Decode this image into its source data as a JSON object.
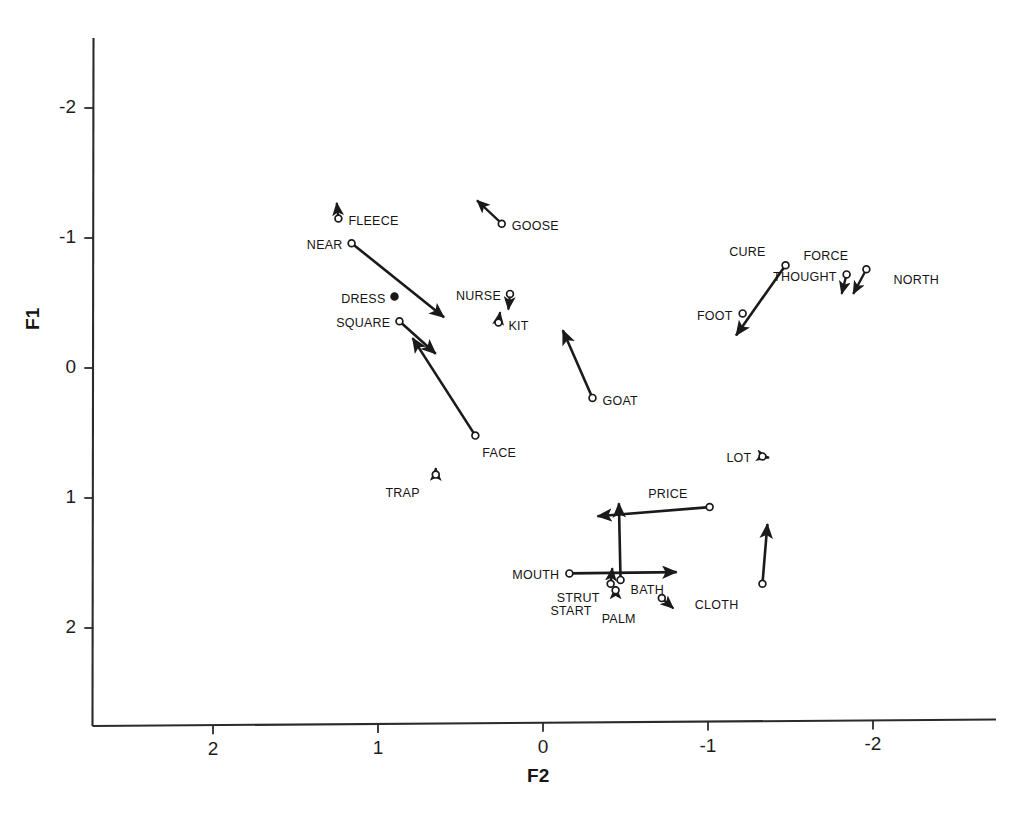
{
  "chart_data": {
    "type": "scatter",
    "title": "",
    "xlabel": "F2",
    "ylabel": "F1",
    "xlim": [
      2.75,
      -2.75
    ],
    "ylim": [
      2.75,
      -2.4
    ],
    "x_ticks": [
      2,
      1,
      0,
      -1,
      -2
    ],
    "x_tick_labels": [
      "2",
      "1",
      "0",
      "-1",
      "-2"
    ],
    "y_ticks": [
      -2,
      -1,
      0,
      1,
      2
    ],
    "y_tick_labels": [
      "-2",
      "-1",
      "0",
      "1",
      "2"
    ],
    "grid": false,
    "legend": false,
    "axes_style": "open-corner-scanned",
    "marker": "open-circle",
    "vector_style": "arrow",
    "points": [
      {
        "label": "FLEECE",
        "x": 1.24,
        "y": -1.15,
        "dx": 0.01,
        "dy": -0.12,
        "label_side": "right",
        "marker": "open",
        "label_dx": 10,
        "label_dy": -5
      },
      {
        "label": "GOOSE",
        "x": 0.25,
        "y": -1.11,
        "dx": 0.15,
        "dy": -0.18,
        "label_side": "right",
        "marker": "open",
        "label_dx": 10,
        "label_dy": -5
      },
      {
        "label": "NEAR",
        "x": 1.16,
        "y": -0.96,
        "dx": -0.56,
        "dy": 0.57,
        "label_side": "left",
        "marker": "open",
        "label_dx": -9,
        "label_dy": -5
      },
      {
        "label": "DRESS",
        "x": 0.9,
        "y": -0.55,
        "dx": 0.0,
        "dy": 0.0,
        "label_side": "left",
        "marker": "filled",
        "label_dx": -9,
        "label_dy": -5
      },
      {
        "label": "NURSE",
        "x": 0.2,
        "y": -0.57,
        "dx": 0.01,
        "dy": 0.12,
        "label_side": "left",
        "marker": "open",
        "label_dx": -9,
        "label_dy": -5
      },
      {
        "label": "KIT",
        "x": 0.27,
        "y": -0.35,
        "dx": -0.01,
        "dy": -0.08,
        "label_side": "right",
        "marker": "open",
        "label_dx": 10,
        "label_dy": -4
      },
      {
        "label": "SQUARE",
        "x": 0.87,
        "y": -0.36,
        "dx": -0.22,
        "dy": 0.25,
        "label_side": "left",
        "marker": "open",
        "label_dx": -9,
        "label_dy": -5
      },
      {
        "label": "FACE",
        "x": 0.41,
        "y": 0.52,
        "dx": 0.38,
        "dy": -0.75,
        "label_side": "right",
        "marker": "open",
        "label_dx": 7,
        "label_dy": 10
      },
      {
        "label": "TRAP",
        "x": 0.65,
        "y": 0.82,
        "dx": 0.0,
        "dy": -0.05,
        "label_side": "below",
        "marker": "open",
        "label_dx": -16,
        "label_dy": 11
      },
      {
        "label": "GOAT",
        "x": -0.3,
        "y": 0.23,
        "dx": 0.18,
        "dy": -0.52,
        "label_side": "right",
        "marker": "open",
        "label_dx": 10,
        "label_dy": -4
      },
      {
        "label": "CURE",
        "x": -1.47,
        "y": -0.79,
        "dx": 0.3,
        "dy": 0.54,
        "label_side": "above",
        "marker": "open",
        "label_dx": -20,
        "label_dy": -20
      },
      {
        "label": "THOUGHT",
        "x": -1.84,
        "y": -0.72,
        "dx": 0.03,
        "dy": 0.15,
        "label_side": "left",
        "marker": "open",
        "label_dx": -10,
        "label_dy": -4
      },
      {
        "label": "FORCE",
        "x": -1.96,
        "y": -0.76,
        "dx": 0.08,
        "dy": 0.19,
        "label_side": "above",
        "marker": "open",
        "label_dx": -18,
        "label_dy": -20
      },
      {
        "label": "NORTH",
        "x": -2.04,
        "y": -0.7,
        "dx": 0.0,
        "dy": 0.0,
        "label_side": "right",
        "marker": "none",
        "label_dx": 14,
        "label_dy": -4
      },
      {
        "label": "FOOT",
        "x": -1.21,
        "y": -0.42,
        "dx": 0.0,
        "dy": 0.0,
        "label_side": "left",
        "marker": "open",
        "label_dx": -10,
        "label_dy": -4
      },
      {
        "label": "LOT",
        "x": -1.33,
        "y": 0.68,
        "dx": -0.04,
        "dy": 0.01,
        "label_side": "left",
        "marker": "open",
        "label_dx": -11,
        "label_dy": -5
      },
      {
        "label": "PRICE",
        "x": -1.01,
        "y": 1.07,
        "dx": 0.68,
        "dy": 0.07,
        "label_side": "above",
        "marker": "open",
        "label_dx": -22,
        "label_dy": -20
      },
      {
        "label": "MOUTH",
        "x": -0.16,
        "y": 1.58,
        "dx": -0.65,
        "dy": -0.01,
        "label_side": "left",
        "marker": "open",
        "label_dx": -10,
        "label_dy": -5
      },
      {
        "label": "BATH",
        "x": -0.47,
        "y": 1.63,
        "dx": 0.01,
        "dy": -0.59,
        "label_side": "right",
        "marker": "open",
        "label_dx": 10,
        "label_dy": 3
      },
      {
        "label": "STRUT",
        "x": -0.41,
        "y": 1.66,
        "dx": -0.01,
        "dy": -0.12,
        "label_side": "left",
        "marker": "open",
        "label_dx": -11,
        "label_dy": 7
      },
      {
        "label": "START",
        "x": -0.44,
        "y": 1.71,
        "dx": 0.0,
        "dy": -0.03,
        "label_side": "below",
        "marker": "open",
        "label_dx": -24,
        "label_dy": 14
      },
      {
        "label": "PALM",
        "x": -0.72,
        "y": 1.77,
        "dx": -0.07,
        "dy": 0.08,
        "label_side": "below",
        "marker": "open",
        "label_dx": -26,
        "label_dy": 14
      },
      {
        "label": "CLOTH",
        "x": -1.33,
        "y": 1.66,
        "dx": -0.03,
        "dy": -0.46,
        "label_side": "below",
        "marker": "open",
        "label_dx": -24,
        "label_dy": 14
      }
    ]
  },
  "axes": {
    "y_axis_title": "F1",
    "x_axis_title": "F2"
  },
  "colors": {
    "ink": "#1a1a1a",
    "axis": "#2b2b2b",
    "background": "#ffffff"
  }
}
